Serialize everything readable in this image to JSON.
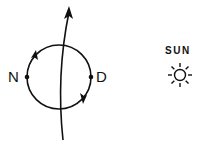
{
  "diagram": {
    "labels": {
      "left_point": "N",
      "right_point": "D",
      "sun": "SUN"
    },
    "icons": [
      "orbit-circle",
      "axis-arrow",
      "sun-icon"
    ],
    "colors": {
      "stroke": "#111111",
      "background": "#ffffff"
    }
  }
}
